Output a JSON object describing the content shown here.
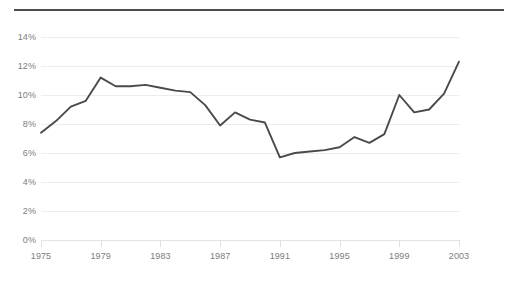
{
  "chart_data": {
    "type": "line",
    "title": "",
    "xlabel": "",
    "ylabel": "",
    "xlim": [
      1975,
      2003
    ],
    "ylim": [
      0,
      14
    ],
    "grid": true,
    "legend": "none",
    "line_color": "#4a4a4a",
    "grid_color": "#ededed",
    "label_color": "#7d7d7d",
    "y_ticks": [
      "0%",
      "2%",
      "4%",
      "6%",
      "8%",
      "10%",
      "12%",
      "14%"
    ],
    "y_tick_values": [
      0,
      2,
      4,
      6,
      8,
      10,
      12,
      14
    ],
    "x_ticks": [
      "1975",
      "1979",
      "1983",
      "1987",
      "1991",
      "1995",
      "1999",
      "2003"
    ],
    "x_tick_values": [
      1975,
      1979,
      1983,
      1987,
      1991,
      1995,
      1999,
      2003
    ],
    "x": [
      1975,
      1976,
      1977,
      1978,
      1979,
      1980,
      1981,
      1982,
      1983,
      1984,
      1985,
      1986,
      1987,
      1988,
      1989,
      1990,
      1991,
      1992,
      1993,
      1994,
      1995,
      1996,
      1997,
      1998,
      1999,
      2000,
      2001,
      2002,
      2003
    ],
    "values": [
      7.4,
      8.2,
      9.2,
      9.6,
      11.2,
      10.6,
      10.6,
      10.7,
      10.5,
      10.3,
      10.2,
      9.3,
      7.9,
      8.8,
      8.3,
      8.1,
      5.7,
      6.0,
      6.1,
      6.2,
      6.4,
      7.1,
      6.7,
      7.3,
      10.0,
      8.8,
      9.0,
      10.1,
      12.3
    ],
    "series": [
      {
        "name": "",
        "values": [
          7.4,
          8.2,
          9.2,
          9.6,
          11.2,
          10.6,
          10.6,
          10.7,
          10.5,
          10.3,
          10.2,
          9.3,
          7.9,
          8.8,
          8.3,
          8.1,
          5.7,
          6.0,
          6.1,
          6.2,
          6.4,
          7.1,
          6.7,
          7.3,
          10.0,
          8.8,
          9.0,
          10.1,
          12.3
        ]
      }
    ],
    "annotations": []
  }
}
